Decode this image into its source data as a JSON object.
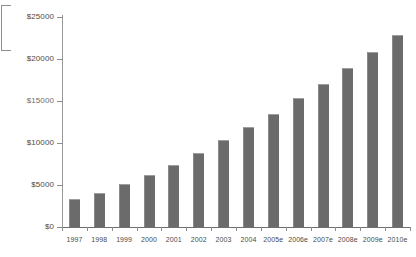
{
  "chart_data": {
    "type": "bar",
    "title": "",
    "subtitle": "",
    "xlabel": "",
    "ylabel": "",
    "grid": false,
    "legend": null,
    "ylim": [
      0,
      25000
    ],
    "ytick_values": [
      0,
      5000,
      10000,
      15000,
      20000,
      25000
    ],
    "ytick_labels": [
      "$0",
      "$5000",
      "$10000",
      "$15000",
      "$20000",
      "$25000"
    ],
    "categories": [
      "1997",
      "1998",
      "1999",
      "2000",
      "2001",
      "2002",
      "2003",
      "2004",
      "2005e",
      "2006e",
      "2007e",
      "2008e",
      "2009e",
      "2010e"
    ],
    "values": [
      3350,
      4050,
      5150,
      6250,
      7350,
      8800,
      10400,
      11900,
      13450,
      15300,
      17000,
      18900,
      20800,
      22850
    ],
    "series": [
      {
        "name": "",
        "values": [
          3350,
          4050,
          5150,
          6250,
          7350,
          8800,
          10400,
          11900,
          13450,
          15300,
          17000,
          18900,
          20800,
          22850
        ]
      }
    ],
    "bar_color": "#6b6b6b",
    "axis_color": "#8c8c8c",
    "background_color": "#ffffff"
  }
}
